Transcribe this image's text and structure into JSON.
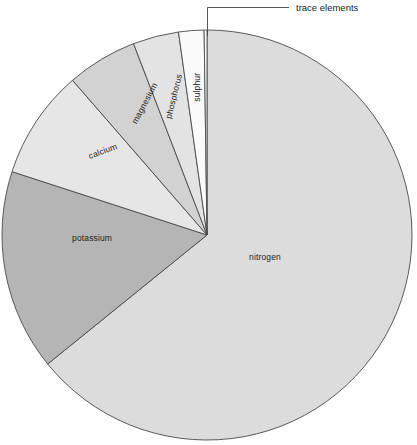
{
  "figure": {
    "type": "pie-chart",
    "background": "#ffffff",
    "center": {
      "x": 207,
      "y": 235
    },
    "radius": 205
  },
  "callout": {
    "label": "trace elements",
    "leader_color": "#444444"
  },
  "caption": {
    "note": "caption text cropped at left edge of the screenshot",
    "lines": [
      "m the",
      "portions",
      "ce the",
      "nts"
    ]
  },
  "chart_data": {
    "type": "pie",
    "title": "",
    "xlabel": "",
    "ylabel": "",
    "legend_position": "none",
    "labels_placement": "inside-slices-rotated",
    "start_angle_deg": 0,
    "direction": "clockwise",
    "categories": [
      "nitrogen",
      "potassium",
      "calcium",
      "magnesium",
      "phosphorus",
      "sulphur",
      "trace elements"
    ],
    "values": [
      64.2,
      15.8,
      8.6,
      5.6,
      3.6,
      1.9,
      0.3
    ],
    "units": "percent",
    "slices": [
      {
        "label": "nitrogen",
        "value": 64.2,
        "start_deg": 0,
        "end_deg": 231.0,
        "fill": "#dcdcdc",
        "stroke": "#4a4a4a",
        "label_x": 265,
        "label_y": 258,
        "label_rotation": 0,
        "label_anchor": "middle"
      },
      {
        "label": "potassium",
        "value": 15.8,
        "start_deg": 231.0,
        "end_deg": 288.0,
        "fill": "#b5b5b5",
        "stroke": "#4a4a4a",
        "label_x": 92,
        "label_y": 239,
        "label_rotation": 0,
        "label_anchor": "middle"
      },
      {
        "label": "calcium",
        "value": 8.6,
        "start_deg": 288.0,
        "end_deg": 319.0,
        "fill": "#e6e6e6",
        "stroke": "#4a4a4a",
        "label_x": 103,
        "label_y": 152,
        "label_rotation": -20,
        "label_anchor": "middle"
      },
      {
        "label": "magnesium",
        "value": 5.6,
        "start_deg": 319.0,
        "end_deg": 339.0,
        "fill": "#d2d2d2",
        "stroke": "#4a4a4a",
        "label_x": 144,
        "label_y": 104,
        "label_rotation": -62,
        "label_anchor": "middle"
      },
      {
        "label": "phosphorus",
        "value": 3.6,
        "start_deg": 339.0,
        "end_deg": 352.0,
        "fill": "#e3e3e3",
        "stroke": "#4a4a4a",
        "label_x": 174,
        "label_y": 97,
        "label_rotation": -76,
        "label_anchor": "middle"
      },
      {
        "label": "sulphur",
        "value": 1.9,
        "start_deg": 352.0,
        "end_deg": 359.2,
        "fill": "#fafafa",
        "stroke": "#4a4a4a",
        "label_x": 197,
        "label_y": 88,
        "label_rotation": -90,
        "label_anchor": "middle"
      },
      {
        "label": "trace elements",
        "value": 0.3,
        "start_deg": 359.2,
        "end_deg": 360.0,
        "fill": "#ffffff",
        "stroke": "#4a4a4a",
        "label_x": 296,
        "label_y": 9,
        "label_rotation": 0,
        "label_anchor": "start"
      }
    ]
  }
}
